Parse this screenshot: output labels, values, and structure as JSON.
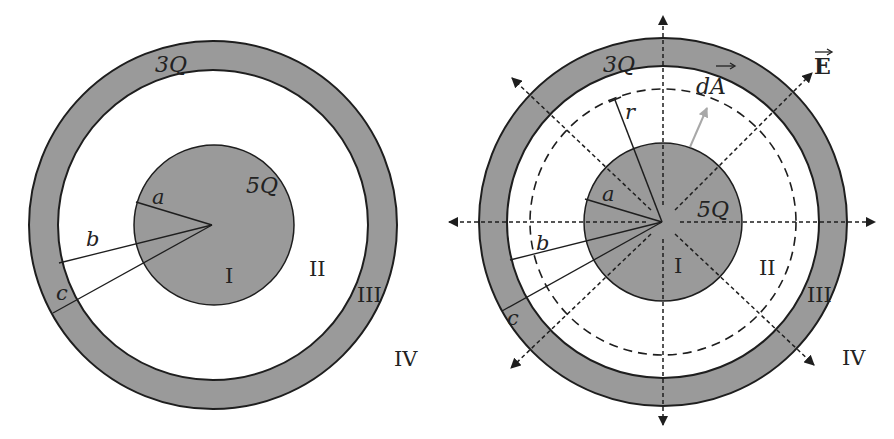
{
  "figure": {
    "fill_color": "#9a9a9a",
    "stroke_color": "#1e1e1e",
    "arrow_gray": "#a8a8a8",
    "left_panel": {
      "title": "Charged conducting sphere inside concentric spherical shell",
      "labels": {
        "shell_charge": "3Q",
        "sphere_charge": "5Q",
        "radius_a": "a",
        "radius_b": "b",
        "radius_c": "c",
        "region_1": "I",
        "region_2": "II",
        "region_3": "III",
        "region_4": "IV"
      }
    },
    "right_panel": {
      "title": "Gaussian surface with radial electric field",
      "labels": {
        "shell_charge": "3Q",
        "sphere_charge": "5Q",
        "radius_a": "a",
        "radius_b": "b",
        "radius_c": "c",
        "radius_r": "r",
        "area_vector": "dA",
        "field_vector": "E",
        "region_1": "I",
        "region_2": "II",
        "region_3": "III",
        "region_4": "IV"
      }
    }
  }
}
